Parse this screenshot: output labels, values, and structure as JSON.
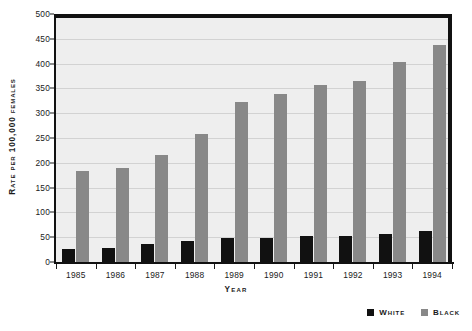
{
  "chart_data": {
    "type": "bar",
    "title": "",
    "xlabel": "Year",
    "ylabel": "Rate per 100,000 females",
    "categories": [
      "1985",
      "1986",
      "1987",
      "1988",
      "1989",
      "1990",
      "1991",
      "1992",
      "1993",
      "1994"
    ],
    "series": [
      {
        "name": "White",
        "color": "#111111",
        "values": [
          27,
          29,
          36,
          42,
          48,
          49,
          52,
          53,
          57,
          62
        ]
      },
      {
        "name": "Black",
        "color": "#888888",
        "values": [
          184,
          190,
          216,
          258,
          322,
          339,
          356,
          364,
          404,
          437
        ]
      }
    ],
    "ylim": [
      0,
      500
    ],
    "ytick_step": 50,
    "yticks": [
      "500",
      "450",
      "400",
      "350",
      "300",
      "250",
      "200",
      "150",
      "100",
      "50",
      "0"
    ],
    "grid": true,
    "legend_position": "bottom-right",
    "plot_background": "#eeeeee",
    "gridline_color": "#d2d2d2",
    "axis_color": "#111111"
  },
  "legend": {
    "entries": [
      {
        "label": "White",
        "color": "#111111"
      },
      {
        "label": "Black",
        "color": "#888888"
      }
    ]
  }
}
